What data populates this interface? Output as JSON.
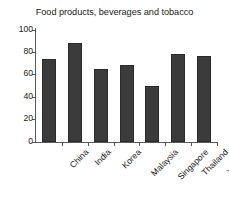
{
  "chart_data": {
    "type": "bar",
    "title": "Food products, beverages and tobacco",
    "xlabel": "",
    "ylabel": "",
    "categories": [
      "China",
      "India",
      "Korea",
      "Malaysia",
      "Singapore",
      "Thailand",
      "Vietnam"
    ],
    "values": [
      74,
      88,
      65,
      68,
      50,
      78,
      76
    ],
    "ylim": [
      0,
      100
    ],
    "yticks": [
      "0",
      "20",
      "40",
      "60",
      "80",
      "100"
    ],
    "ytick_values": [
      0,
      20,
      40,
      60,
      80,
      100
    ],
    "grid": false,
    "legend": false,
    "bar_color": "#3b3b3b",
    "axis_color": "#5a5a5a",
    "background": "#ffffff",
    "tick_label_rotation": -45
  }
}
